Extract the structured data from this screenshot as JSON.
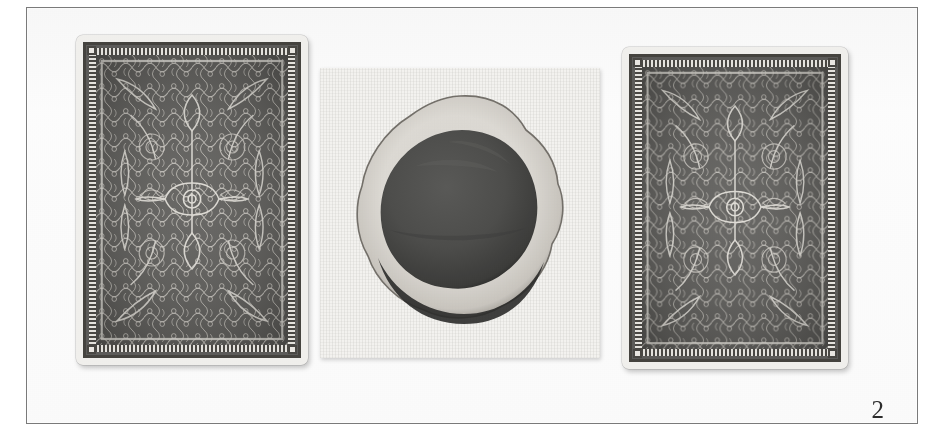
{
  "plate": {
    "figure_number": "2",
    "caption": "",
    "background_color": "#ffffff",
    "frame_color": "#7a7a7a"
  },
  "objects": [
    {
      "id": "card-left",
      "name": "playing-card-back-left",
      "label": "Playing card back (left)",
      "pattern": "ornate symmetrical filigree / scrollwork",
      "face_color": "#5d5c5a",
      "border_color": "#46443f",
      "paper_color": "#f3f2ef"
    },
    {
      "id": "paper-swatch",
      "name": "paper-swatch-with-ink-blot",
      "label": "Paper swatch with circular ink blot",
      "paper_color": "#f6f5f2",
      "blot_core_color": "#4a4a4a",
      "blot_halo_color": "#dcdad5",
      "blot_rim_color": "#232323"
    },
    {
      "id": "card-right",
      "name": "playing-card-back-right",
      "label": "Playing card back (right)",
      "pattern": "ornate symmetrical filigree / scrollwork",
      "face_color": "#5d5c5a",
      "border_color": "#46443f",
      "paper_color": "#f3f2ef"
    }
  ]
}
